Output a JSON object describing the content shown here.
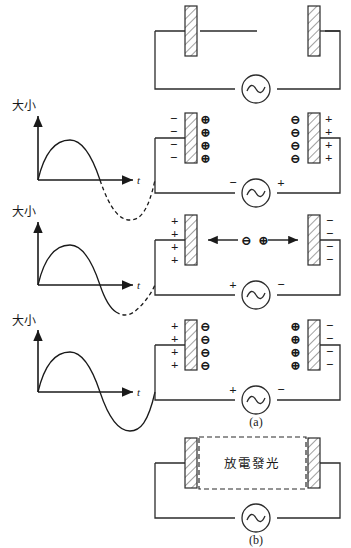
{
  "figure": {
    "stroke_color": "#2b2b2b",
    "hatch_color": "#6e6e6e",
    "background": "#ffffff"
  },
  "waveforms": [
    {
      "id": "waveform-1",
      "y_axis_label": "大小",
      "x_axis_label": "t",
      "solid_phase_end_deg": 180,
      "description": "positive half cycle solid, negative half dashed"
    },
    {
      "id": "waveform-2",
      "y_axis_label": "大小",
      "x_axis_label": "t",
      "solid_phase_end_deg": 220,
      "description": "through zero crossing solid, remainder dashed"
    },
    {
      "id": "waveform-3",
      "y_axis_label": "大小",
      "x_axis_label": "t",
      "solid_phase_end_deg": 360,
      "description": "full cycle solid"
    }
  ],
  "circuits": [
    {
      "id": "circuit-1",
      "source_symbol": "~",
      "source_left_sign": "",
      "source_right_sign": "",
      "left_plate": {
        "outer_signs": [],
        "inner_signs": []
      },
      "right_plate": {
        "inner_signs": [],
        "outer_signs": []
      },
      "migration": null
    },
    {
      "id": "circuit-2",
      "source_symbol": "~",
      "source_left_sign": "−",
      "source_right_sign": "+",
      "left_plate": {
        "outer_signs": [
          "−",
          "−",
          "−",
          "−"
        ],
        "inner_signs": [
          "⊕",
          "⊕",
          "⊕",
          "⊕"
        ]
      },
      "right_plate": {
        "inner_signs": [
          "⊖",
          "⊖",
          "⊖",
          "⊖"
        ],
        "outer_signs": [
          "+",
          "+",
          "+",
          "+"
        ]
      },
      "migration": null
    },
    {
      "id": "circuit-3",
      "source_symbol": "~",
      "source_left_sign": "+",
      "source_right_sign": "−",
      "left_plate": {
        "outer_signs": [
          "+",
          "+",
          "+",
          "+"
        ],
        "inner_signs": []
      },
      "right_plate": {
        "inner_signs": [],
        "outer_signs": [
          "−",
          "−",
          "−",
          "−"
        ]
      },
      "migration": {
        "left_charge": "⊖",
        "right_charge": "⊕",
        "left_arrow": "←",
        "right_arrow": "→"
      }
    },
    {
      "id": "circuit-4",
      "source_symbol": "~",
      "source_left_sign": "+",
      "source_right_sign": "−",
      "left_plate": {
        "outer_signs": [
          "+",
          "+",
          "+",
          "+"
        ],
        "inner_signs": [
          "⊖",
          "⊖",
          "⊖",
          "⊖"
        ]
      },
      "right_plate": {
        "inner_signs": [
          "⊕",
          "⊕",
          "⊕",
          "⊕"
        ],
        "outer_signs": [
          "−",
          "−",
          "−",
          "−"
        ]
      },
      "migration": null
    }
  ],
  "panel_a": {
    "label": "(a)"
  },
  "panel_b": {
    "label": "(b)",
    "glow_region_text": "放電發光",
    "source_symbol": "~"
  }
}
